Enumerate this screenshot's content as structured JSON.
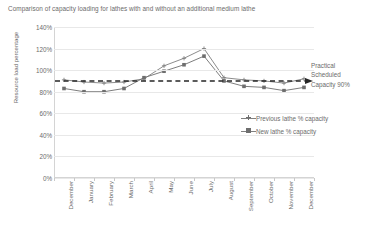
{
  "chart_data": {
    "type": "line",
    "title": "Comparison of capacity loading for lathes with and without an additional medium lathe",
    "xlabel": "",
    "ylabel": "Resource load percentage",
    "ylim": [
      0,
      140
    ],
    "ytick_labels": [
      "0%",
      "20%",
      "40%",
      "60%",
      "80%",
      "100%",
      "120%",
      "140%"
    ],
    "ytick_values": [
      0,
      20,
      40,
      60,
      80,
      100,
      120,
      140
    ],
    "grid": true,
    "legend_position": "right",
    "categories": [
      "December",
      "January",
      "February",
      "March",
      "April",
      "May",
      "June",
      "July",
      "August",
      "September",
      "October",
      "November",
      "December"
    ],
    "series": [
      {
        "name": "Previous lathe % capacity",
        "marker": "cross",
        "color": "#7f7f7f",
        "values": [
          91,
          89,
          88,
          89,
          92,
          104,
          111,
          120,
          93,
          91,
          90,
          88,
          92
        ]
      },
      {
        "name": "New lathe % capacity",
        "marker": "square",
        "color": "#6e6e6e",
        "values": [
          83,
          80,
          80,
          83,
          93,
          99,
          105,
          113,
          90,
          85,
          84,
          81,
          84
        ]
      }
    ],
    "annotations": [
      {
        "name": "practical-scheduled-capacity",
        "lines": [
          "Practical",
          "Scheduled",
          "Capacity 90%"
        ],
        "value": 90,
        "style": "dashed-line-with-arrow",
        "color": "#262626"
      }
    ]
  }
}
